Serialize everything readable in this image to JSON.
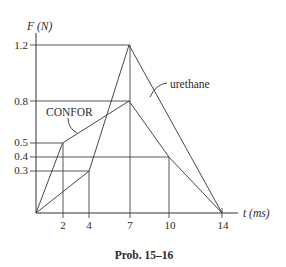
{
  "chart_data": {
    "type": "line",
    "title": "",
    "caption": "Prob. 15–16",
    "xlabel": "t (ms)",
    "ylabel": "F (N)",
    "xlim": [
      0,
      14
    ],
    "ylim": [
      0,
      1.2
    ],
    "grid": false,
    "x_ticks": [
      2,
      4,
      7,
      10,
      14
    ],
    "y_ticks": [
      0.3,
      0.4,
      0.5,
      0.8,
      1.2
    ],
    "series": [
      {
        "name": "CONFOR",
        "points": [
          [
            0,
            0
          ],
          [
            2,
            0.5
          ],
          [
            7,
            0.8
          ],
          [
            10,
            0.4
          ],
          [
            14,
            0
          ]
        ]
      },
      {
        "name": "urethane",
        "points": [
          [
            0,
            0
          ],
          [
            4,
            0.3
          ],
          [
            7,
            1.2
          ],
          [
            14,
            0
          ]
        ]
      }
    ],
    "legend": "inline callout labels"
  },
  "labels": {
    "y_axis": "F (N)",
    "x_axis": "t (ms)",
    "confor": "CONFOR",
    "urethane": "urethane",
    "caption": "Prob. 15–16",
    "x_tick_labels": [
      "2",
      "4",
      "7",
      "10",
      "14"
    ],
    "y_tick_labels": [
      "1.2",
      "0.8",
      "0.5",
      "0.4",
      "0.3"
    ]
  }
}
